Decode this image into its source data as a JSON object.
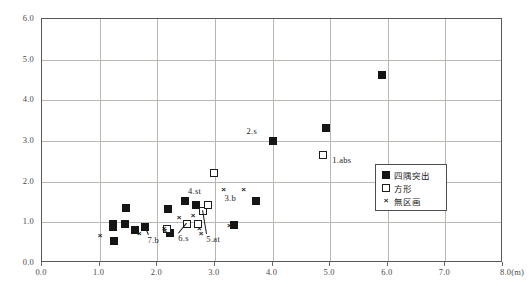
{
  "chart_data": {
    "type": "scatter",
    "title": "",
    "xlabel": "(m)",
    "ylabel": "",
    "xlim": [
      0.0,
      8.0
    ],
    "ylim": [
      0.0,
      6.0
    ],
    "grid": true,
    "legend_position": "inside-right",
    "xticks": [
      "0.0",
      "1.0",
      "2.0",
      "3.0",
      "4.0",
      "5.0",
      "6.0",
      "7.0",
      "8.0(m)"
    ],
    "xtick_values": [
      0.0,
      1.0,
      2.0,
      3.0,
      4.0,
      5.0,
      6.0,
      7.0,
      8.0
    ],
    "yticks": [
      "0.0",
      "1.0",
      "2.0",
      "3.0",
      "4.0",
      "5.0",
      "6.0"
    ],
    "ytick_values": [
      0.0,
      1.0,
      2.0,
      3.0,
      4.0,
      5.0,
      6.0
    ],
    "series": [
      {
        "name": "四隅突出",
        "marker": "filled-square",
        "color": "#151515",
        "points": [
          [
            1.23,
            0.95
          ],
          [
            1.23,
            0.88
          ],
          [
            1.25,
            0.53
          ],
          [
            1.44,
            0.95
          ],
          [
            1.46,
            1.35
          ],
          [
            1.62,
            0.8
          ],
          [
            1.78,
            0.89
          ],
          [
            2.18,
            1.33
          ],
          [
            2.22,
            0.73
          ],
          [
            2.48,
            1.52
          ],
          [
            2.68,
            1.42
          ],
          [
            3.33,
            0.93
          ],
          [
            3.72,
            1.53
          ],
          [
            4.0,
            3.0
          ],
          [
            4.92,
            3.33
          ],
          [
            5.9,
            4.62
          ]
        ]
      },
      {
        "name": "方形",
        "marker": "open-square",
        "color": "#1d1d1d",
        "points": [
          [
            2.17,
            0.84
          ],
          [
            2.52,
            0.95
          ],
          [
            2.7,
            0.95
          ],
          [
            2.8,
            1.28
          ],
          [
            2.88,
            1.42
          ],
          [
            2.98,
            2.22
          ],
          [
            4.88,
            2.65
          ]
        ]
      },
      {
        "name": "無区画",
        "marker": "cross",
        "color": "#1d1d1d",
        "points": [
          [
            1.01,
            0.7
          ],
          [
            1.69,
            0.73
          ],
          [
            2.12,
            0.87
          ],
          [
            2.13,
            0.82
          ],
          [
            2.38,
            1.12
          ],
          [
            2.62,
            1.17
          ],
          [
            2.73,
            0.87
          ],
          [
            2.76,
            0.75
          ],
          [
            3.15,
            1.82
          ],
          [
            3.25,
            0.93
          ],
          [
            3.5,
            1.82
          ]
        ]
      }
    ],
    "annotations": [
      {
        "label": "1.abs",
        "x": 4.88,
        "y": 2.65,
        "dx": 10,
        "dy": 7
      },
      {
        "label": "2.s",
        "x": 4.0,
        "y": 3.0,
        "dx": -25,
        "dy": -8
      },
      {
        "label": "3.b",
        "x": 3.15,
        "y": 1.82,
        "dx": 2,
        "dy": 11
      },
      {
        "label": "4.st",
        "x": 2.48,
        "y": 1.52,
        "dx": 4,
        "dy": -8
      },
      {
        "label": "5.at",
        "x": 2.8,
        "y": 1.28,
        "dx": 4,
        "dy": 30
      },
      {
        "label": "6.s",
        "x": 2.52,
        "y": 0.95,
        "dx": -8,
        "dy": 16
      },
      {
        "label": "7.b",
        "x": 1.78,
        "y": 0.89,
        "dx": 4,
        "dy": 15
      }
    ]
  },
  "legend": {
    "items": [
      {
        "label": "四隅突出",
        "marker": "filled-square"
      },
      {
        "label": "方形",
        "marker": "open-square"
      },
      {
        "label": "無区画",
        "marker": "cross"
      }
    ]
  },
  "glyphs": {
    "cross": "×"
  }
}
